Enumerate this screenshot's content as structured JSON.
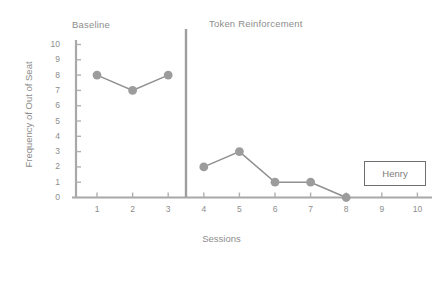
{
  "chart_data": {
    "type": "line",
    "title": "",
    "xlabel": "Sessions",
    "ylabel": "Frequency of Out of Seat",
    "xlim": [
      0,
      10
    ],
    "ylim": [
      0,
      10
    ],
    "x_ticks": [
      1,
      2,
      3,
      4,
      5,
      6,
      7,
      8,
      9,
      10
    ],
    "y_ticks": [
      0,
      1,
      2,
      3,
      4,
      5,
      6,
      7,
      8,
      9,
      10
    ],
    "grid": false,
    "legend_position": "bottom-right",
    "legend_entries": [
      "Henry"
    ],
    "phase_change_line_x": 3.5,
    "annotations": [
      "Baseline",
      "Token Reinforcement"
    ],
    "series": [
      {
        "name": "Baseline",
        "phase": "Baseline",
        "x": [
          1,
          2,
          3
        ],
        "values": [
          8,
          7,
          8
        ]
      },
      {
        "name": "Token Reinforcement",
        "phase": "Token Reinforcement",
        "x": [
          4,
          5,
          6,
          7,
          8
        ],
        "values": [
          2,
          3,
          1,
          1,
          0
        ]
      }
    ],
    "marker_color": "#9c9c9c",
    "line_color": "#8f8f8f",
    "axis_color": "#a6a6a6"
  },
  "labels": {
    "phase_baseline": "Baseline",
    "phase_treatment": "Token Reinforcement",
    "y_axis_title": "Frequency of Out of Seat",
    "x_axis_title": "Sessions",
    "legend_name": "Henry"
  },
  "ticks": {
    "y": [
      "10",
      "9",
      "8",
      "7",
      "6",
      "5",
      "4",
      "3",
      "2",
      "1",
      "0"
    ],
    "x": [
      "1",
      "2",
      "3",
      "4",
      "5",
      "6",
      "7",
      "8",
      "9",
      "10"
    ]
  }
}
